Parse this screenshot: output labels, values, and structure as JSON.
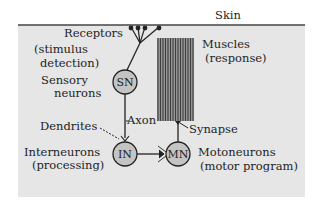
{
  "diagram": {
    "skin_label": "Skin",
    "receptors": {
      "label": "Receptors",
      "sublabel_1": "(stimulus",
      "sublabel_2": "detection)"
    },
    "sensory": {
      "circle_text": "SN",
      "label_1": "Sensory",
      "label_2": "neurons"
    },
    "interneuron": {
      "circle_text": "IN",
      "label_1": "Interneurons",
      "label_2": "(processing)"
    },
    "motoneuron": {
      "circle_text": "MN",
      "label_1": "Motoneurons",
      "label_2": "(motor program)"
    },
    "muscles": {
      "label_1": "Muscles",
      "label_2": "(response)"
    },
    "annotations": {
      "axon": "Axon",
      "dendrites": "Dendrites",
      "synapse": "Synapse"
    },
    "colors": {
      "panel": "#e6e6e6",
      "skin_line": "#444444",
      "circle_fill": "#c4c4c4",
      "muscle_stripes": "#555555",
      "line": "#222222"
    }
  }
}
